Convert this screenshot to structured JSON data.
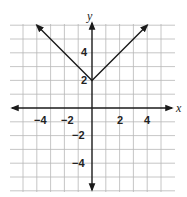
{
  "chart_data": {
    "type": "line",
    "title": "",
    "function": "y = |x| + 2",
    "xlabel": "x",
    "ylabel": "y",
    "xlim": [
      -6,
      6
    ],
    "ylim": [
      -6,
      6
    ],
    "grid": true,
    "x_tick_labels": [
      "-4",
      "-2",
      "2",
      "4"
    ],
    "y_tick_labels": [
      "4",
      "2",
      "-2",
      "-4"
    ],
    "series": [
      {
        "name": "absolute value graph",
        "x": [
          -4,
          0,
          4
        ],
        "y": [
          6,
          2,
          6
        ],
        "arrows": "both ends"
      }
    ],
    "vertex": [
      0,
      2
    ]
  },
  "labels": {
    "x_axis": "x",
    "y_axis": "y",
    "x_ticks": [
      "−4",
      "−2",
      "2",
      "4"
    ],
    "y_ticks": [
      "4",
      "2",
      "−2",
      "−4"
    ]
  }
}
